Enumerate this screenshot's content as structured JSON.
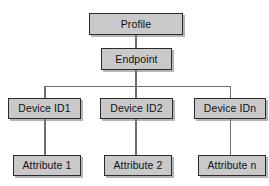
{
  "diagram": {
    "type": "tree",
    "colors": {
      "node_fill": "#c9c9c9",
      "node_border": "#2b2b2b",
      "edge": "#6e6e6e",
      "background": "#ffffff",
      "text": "#111111"
    },
    "nodes": {
      "profile": {
        "label": "Profile",
        "level": 0
      },
      "endpoint": {
        "label": "Endpoint",
        "level": 1
      },
      "device_1": {
        "label": "Device ID1",
        "level": 2
      },
      "device_2": {
        "label": "Device ID2",
        "level": 2
      },
      "device_n": {
        "label": "Device IDn",
        "level": 2
      },
      "attribute_1": {
        "label": "Attribute 1",
        "level": 3
      },
      "attribute_2": {
        "label": "Attribute 2",
        "level": 3
      },
      "attribute_n": {
        "label": "Attribute n",
        "level": 3
      }
    },
    "edges": [
      {
        "from": "profile",
        "to": "endpoint"
      },
      {
        "from": "endpoint",
        "to": "device_1"
      },
      {
        "from": "endpoint",
        "to": "device_2"
      },
      {
        "from": "endpoint",
        "to": "device_n"
      },
      {
        "from": "device_1",
        "to": "attribute_1"
      },
      {
        "from": "device_2",
        "to": "attribute_2"
      },
      {
        "from": "device_n",
        "to": "attribute_n"
      }
    ]
  }
}
